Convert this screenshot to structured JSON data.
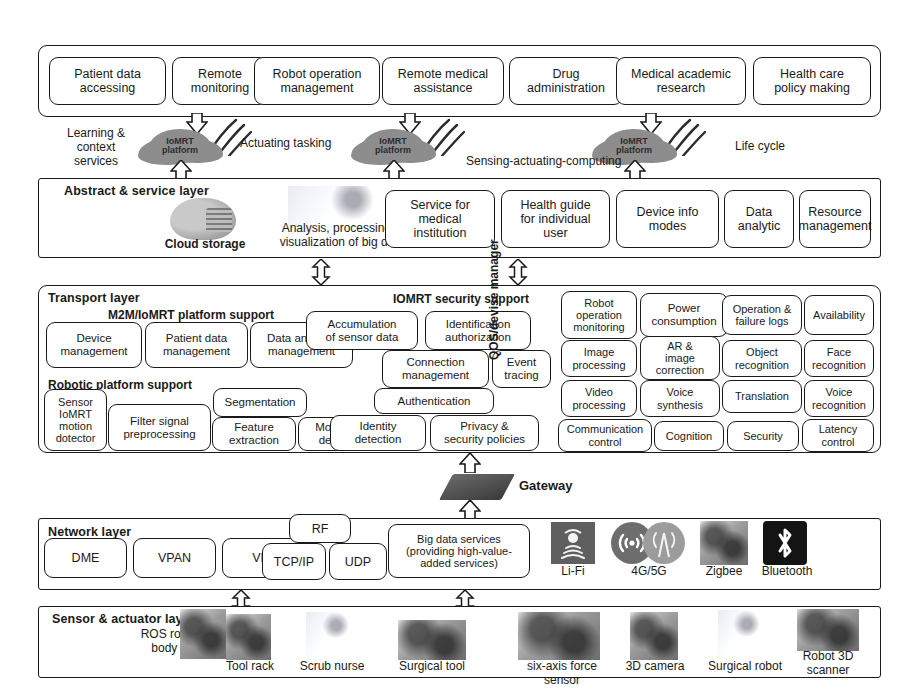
{
  "application_layer": {
    "boxes": [
      "Patient data\naccessing",
      "Remote\nmonitoring",
      "Robot operation\nmanagement",
      "Remote medical\nassistance",
      "Drug\nadministration",
      "Medical academic\nresearch",
      "Health care\npolicy making"
    ]
  },
  "platform_band": {
    "clouds": [
      {
        "name": "IoMRT\nplatform"
      },
      {
        "name": "IoMRT\nplatform"
      },
      {
        "name": "IoMRT\nplatform"
      }
    ],
    "labels": [
      "Learning &\ncontext\nservices",
      "Actuating tasking",
      "Sensing-actuating-computing",
      "Life cycle"
    ]
  },
  "abstract_layer": {
    "title": "Abstract & service layer",
    "cloud_storage_caption": "Cloud storage",
    "bigdata_caption": "Analysis, processing &\nvisualization of big data",
    "boxes": [
      "Service for\nmedical\ninstitution",
      "Health guide\nfor individual\nuser",
      "Device info\nmodes",
      "Data\nanalytic",
      "Resource\nmanagement"
    ]
  },
  "transport_layer": {
    "title": "Transport layer",
    "group_m2m": "M2M/IoMRT platform support",
    "group_security": "IOMRT security support",
    "group_robotic": "Robotic platform support",
    "qos_label": "QOS/devise manager",
    "m2m_boxes": [
      "Device\nmanagement",
      "Patient data\nmanagement",
      "Data analysis\nmanagement",
      "Accumulation\nof sensor data"
    ],
    "security_boxes": [
      "Identification\nauthorization",
      "Connection\nmanagement",
      "Event\ntracing",
      "Authentication",
      "Privacy &\nsecurity policies"
    ],
    "robotic_boxes": [
      "Sensor\nIoMRT\nmotion\ndotector",
      "Filter signal\npreprocessing",
      "Segmentation",
      "Feature\nextraction",
      "Movement\ndetection",
      "Identity\ndetection"
    ],
    "qos_boxes": [
      "Robot\noperation\nmonitoring",
      "Power\nconsumption",
      "Operation &\nfailure logs",
      "Availability",
      "Image\nprocessing",
      "AR &\nimage\ncorrection",
      "Object\nrecognition",
      "Face\nrecognition",
      "Video\nprocessing",
      "Voice\nsynthesis",
      "Translation",
      "Voice\nrecognition",
      "Communication\ncontrol",
      "Cognition",
      "Security",
      "Latency\ncontrol"
    ]
  },
  "gateway": {
    "label": "Gateway"
  },
  "network_layer": {
    "title": "Network layer",
    "boxes": [
      "DME",
      "VPAN",
      "VPPM",
      "RF",
      "TCP/IP",
      "UDP",
      "Big data services\n(providing high-value-\nadded services)"
    ],
    "technologies": [
      {
        "label": "Li-Fi",
        "icon": "lifi-icon"
      },
      {
        "label": "4G/5G",
        "icon": "cellular-antenna-icon"
      },
      {
        "label": "Zigbee",
        "icon": "zigbee-module-icon"
      },
      {
        "label": "Bluetooth",
        "icon": "bluetooth-icon"
      }
    ]
  },
  "sensor_layer": {
    "title": "Sensor & actuator layer",
    "ros_caption": "ROS robotic\nbody scan",
    "devices": [
      {
        "label": "Tool rack",
        "icon": "tool-rack-photo"
      },
      {
        "label": "Scrub nurse",
        "icon": "scrub-nurse-photo"
      },
      {
        "label": "Surgical tool",
        "icon": "surgical-tool-photo"
      },
      {
        "label": "six-axis force sensor",
        "icon": "force-sensor-photo"
      },
      {
        "label": "3D camera",
        "icon": "camera-photo"
      },
      {
        "label": "Surgical robot",
        "icon": "surgical-robot-photo"
      },
      {
        "label": "Robot 3D\nscanner",
        "icon": "robot-3d-scanner-photo"
      }
    ]
  }
}
